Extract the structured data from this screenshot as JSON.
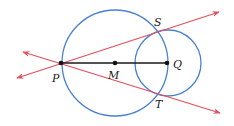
{
  "diagram": {
    "colors": {
      "circle": "#4a80d2",
      "line": "#e2505c",
      "segment": "#1a1a1a",
      "point": "#111111"
    },
    "circles": [
      {
        "name": "large-circle",
        "center": "M",
        "cx": 115,
        "cy": 63,
        "r": 53
      },
      {
        "name": "small-circle",
        "center": "Q",
        "cx": 168,
        "cy": 63,
        "r": 33
      }
    ],
    "points": [
      {
        "id": "P",
        "label": "P",
        "x": 61,
        "y": 63,
        "lx": 52,
        "ly": 82
      },
      {
        "id": "M",
        "label": "M",
        "x": 115,
        "y": 63,
        "lx": 108,
        "ly": 79
      },
      {
        "id": "Q",
        "label": "Q",
        "x": 167,
        "y": 63,
        "lx": 173,
        "ly": 68
      },
      {
        "id": "S",
        "label": "S",
        "x": 158,
        "y": 32,
        "lx": 154,
        "ly": 26
      },
      {
        "id": "T",
        "label": "T",
        "x": 158,
        "y": 94,
        "lx": 155,
        "ly": 108
      }
    ],
    "segment": {
      "from": "P",
      "to": "Q"
    },
    "lines": [
      {
        "name": "line-PS",
        "x1": 17,
        "y1": 78,
        "x2": 219,
        "y2": 12
      },
      {
        "name": "line-PT",
        "x1": 23,
        "y1": 52,
        "x2": 220,
        "y2": 113
      }
    ]
  }
}
